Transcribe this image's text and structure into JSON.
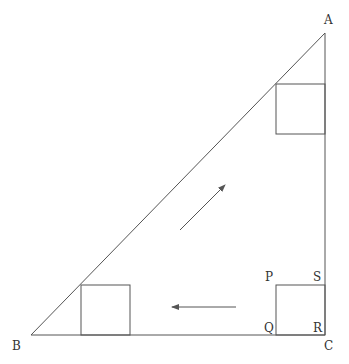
{
  "figure": {
    "type": "geometry-diagram",
    "stroke_color": "#555555",
    "vertices": {
      "A": {
        "label": "A",
        "x": 325,
        "y": 33
      },
      "B": {
        "label": "B",
        "x": 31,
        "y": 335
      },
      "C": {
        "label": "C",
        "x": 325,
        "y": 335
      }
    },
    "square_labels": {
      "P": "P",
      "Q": "Q",
      "R": "R",
      "S": "S"
    },
    "squares": [
      {
        "name": "square-top",
        "x": 276,
        "y": 84,
        "size": 50
      },
      {
        "name": "square-pqrs",
        "x": 276,
        "y": 285,
        "size": 50
      },
      {
        "name": "square-left",
        "x": 81,
        "y": 285,
        "size": 50
      }
    ],
    "arrows": [
      {
        "name": "arrow-diagonal",
        "from": [
          180,
          230
        ],
        "to": [
          225,
          185
        ],
        "direction": "up-right"
      },
      {
        "name": "arrow-left",
        "from": [
          236,
          307
        ],
        "to": [
          172,
          307
        ],
        "direction": "left"
      }
    ]
  }
}
